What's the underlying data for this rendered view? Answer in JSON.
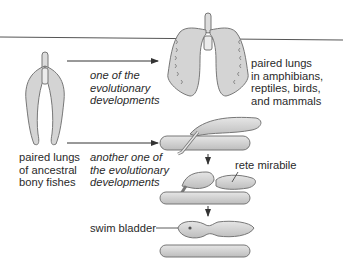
{
  "diagram": {
    "labels": {
      "ancestral": "paired lungs\nof ancestral\nbony fishes",
      "path_one": "one of the\nevolutionary\ndevelopments",
      "tetrapod_lungs": "paired lungs\nin amphibians,\nreptiles, birds,\nand mammals",
      "path_two": "another one of\nthe evolutionary\ndevelopments",
      "rete": "rete mirabile",
      "swim_bladder": "swim bladder"
    },
    "colors": {
      "organ_fill": "#d8d8d8",
      "organ_stroke": "#6f6f6f",
      "line": "#333333",
      "text": "#2a2a2a"
    }
  }
}
